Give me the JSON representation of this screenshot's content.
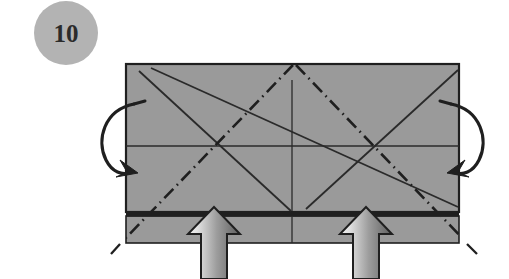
{
  "page": {
    "background_color": "#ffffff",
    "width": 509,
    "height": 279
  },
  "step_badge": {
    "number": "10",
    "shape": "circle",
    "fill_color": "#b3b3b3",
    "text_color": "#2b2b2b",
    "center_x": 66,
    "center_y": 33,
    "radius": 32
  },
  "paper": {
    "name": "folded-paper-sheet",
    "fill_color": "#9a9a9a",
    "edge_color": "#1f1f1f",
    "main_panel": {
      "x": 126,
      "y": 64,
      "width": 333,
      "height": 148
    },
    "dark_band": {
      "x": 126,
      "y": 212,
      "width": 333,
      "height": 5,
      "fill_color": "#1f1f1f"
    },
    "lower_band": {
      "x": 126,
      "y": 217,
      "width": 333,
      "height": 26,
      "fill_color": "#9a9a9a"
    }
  },
  "crease_lines": {
    "horizontal_center": {
      "label": "horizontal center crease",
      "style": "solid",
      "x1": 127,
      "y1": 146,
      "x2": 458,
      "y2": 146
    },
    "vertical_center": {
      "label": "vertical center crease",
      "style": "solid",
      "x1": 292,
      "y1": 82,
      "x2": 292,
      "y2": 211
    },
    "vertical_center_lower": {
      "label": "vertical center crease lower band",
      "style": "solid",
      "x1": 292,
      "y1": 218,
      "x2": 292,
      "y2": 242
    },
    "solid_diagonals": [
      {
        "label": "solid diagonal upper-left to lower-center",
        "x1": 140,
        "y1": 72,
        "x2": 291,
        "y2": 211
      },
      {
        "label": "solid diagonal upper-left long to lower-right",
        "x1": 152,
        "y1": 69,
        "x2": 456,
        "y2": 206
      },
      {
        "label": "solid diagonal lower-center to upper-right",
        "x1": 307,
        "y1": 208,
        "x2": 457,
        "y2": 71
      }
    ],
    "dash_dot_folds": [
      {
        "label": "valley fold top-center to lower-left beyond edge",
        "x1": 293,
        "y1": 66,
        "x2": 115,
        "y2": 252
      },
      {
        "label": "valley fold top-center to lower-right beyond edge",
        "x1": 296,
        "y1": 66,
        "x2": 473,
        "y2": 252
      }
    ]
  },
  "fold_arrows": {
    "left": {
      "name": "left-fold-arrow",
      "description": "curved arrow folding left edge inward",
      "color": "#1f1f1f"
    },
    "right": {
      "name": "right-fold-arrow",
      "description": "curved arrow folding right edge inward",
      "color": "#1f1f1f"
    }
  },
  "push_arrows": [
    {
      "name": "left-push-arrow",
      "description": "thick block arrow pointing up",
      "gradient_light": "#ececec",
      "gradient_dark": "#6d6d6d",
      "outline_color": "#1f1f1f",
      "tip_x": 214,
      "tip_y": 208
    },
    {
      "name": "right-push-arrow",
      "description": "thick block arrow pointing up",
      "gradient_light": "#ececec",
      "gradient_dark": "#6d6d6d",
      "outline_color": "#1f1f1f",
      "tip_x": 366,
      "tip_y": 208
    }
  ]
}
